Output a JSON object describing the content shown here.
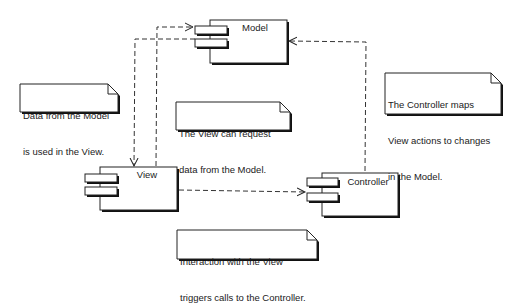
{
  "diagram": {
    "type": "UML component diagram",
    "components": [
      {
        "id": "model",
        "name": "Model"
      },
      {
        "id": "view",
        "name": "View"
      },
      {
        "id": "controller",
        "name": "Controller"
      }
    ],
    "notes": [
      {
        "id": "note-data-from-model",
        "lines": [
          "Data from the Model",
          "is used in the View."
        ]
      },
      {
        "id": "note-view-request",
        "lines": [
          "The View can request",
          "data from the Model."
        ]
      },
      {
        "id": "note-controller-maps",
        "lines": [
          "The Controller maps",
          "View actions to changes",
          "in the Model."
        ]
      },
      {
        "id": "note-interaction",
        "lines": [
          "Interaction with the View",
          "triggers calls to the Controller."
        ]
      }
    ],
    "dependencies": [
      {
        "from": "View",
        "to": "Model",
        "style": "dashed",
        "arrow": "open"
      },
      {
        "from": "Model",
        "to": "View",
        "style": "dashed",
        "arrow": "open"
      },
      {
        "from": "View",
        "to": "Controller",
        "style": "dashed",
        "arrow": "open"
      },
      {
        "from": "Controller",
        "to": "Model",
        "style": "dashed",
        "arrow": "open"
      }
    ],
    "colors": {
      "line": "#222222",
      "shadow": "#111111",
      "fill": "#ffffff"
    }
  }
}
